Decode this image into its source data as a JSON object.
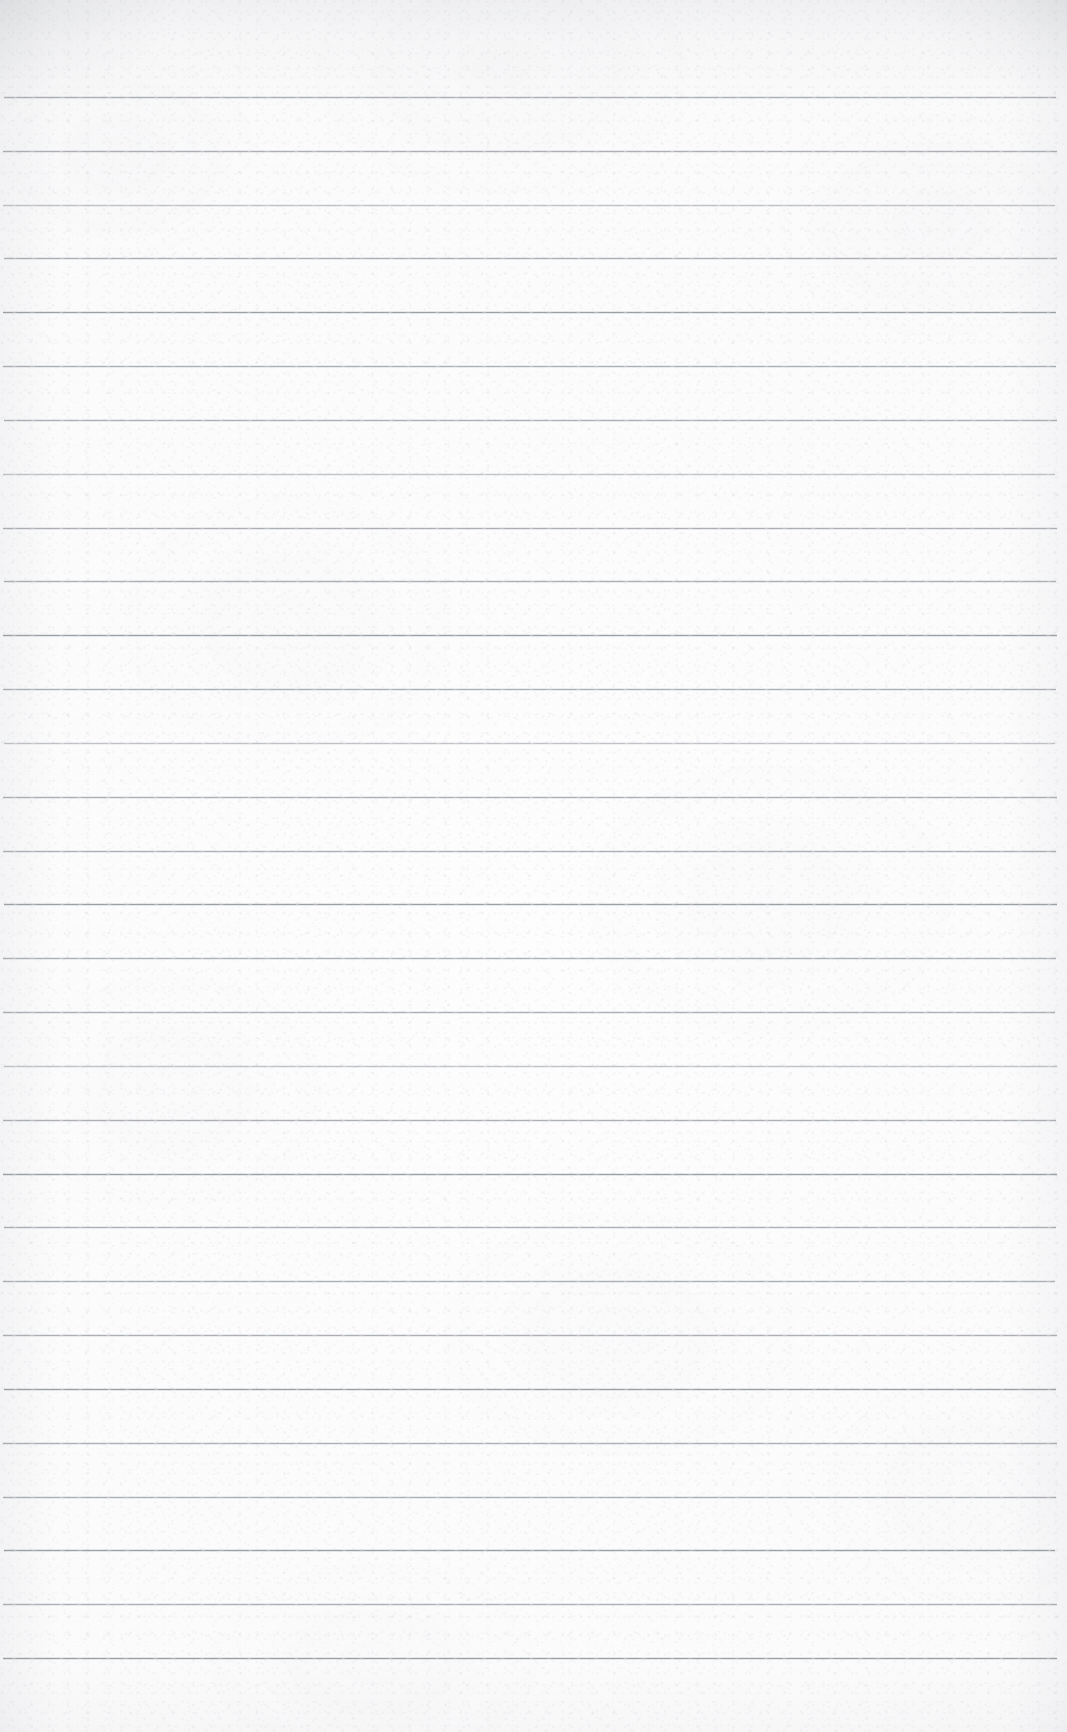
{
  "document": {
    "kind": "scanned-lined-paper",
    "title": "Blank Ruled Notebook Page",
    "content_text": "",
    "has_handwriting": false,
    "has_printed_text": false,
    "page_width": 1067,
    "page_height": 1732
  },
  "paper": {
    "background_color": "#fbfbfc",
    "edge_shade_color": "#94979d",
    "texture": "mottled-fibre",
    "vignette": "top-and-side-edges"
  },
  "ruling": {
    "line_color": "#9ba0a6",
    "line_thickness_px": 1,
    "line_count": 30,
    "first_line_y": 97,
    "line_spacing_px": 53.8,
    "line_start_x": 3,
    "line_end_x": 1057,
    "top_margin_px": 97,
    "bottom_margin_px": 74,
    "has_vertical_margin_rule": false,
    "lines": [
      {
        "y": 97,
        "x1": 4,
        "x2": 1056,
        "weight": "mid"
      },
      {
        "y": 151,
        "x1": 3,
        "x2": 1057,
        "weight": "mid"
      },
      {
        "y": 205,
        "x1": 3,
        "x2": 1055,
        "weight": "light"
      },
      {
        "y": 258,
        "x1": 4,
        "x2": 1057,
        "weight": "mid"
      },
      {
        "y": 312,
        "x1": 3,
        "x2": 1056,
        "weight": "dark"
      },
      {
        "y": 366,
        "x1": 3,
        "x2": 1056,
        "weight": "mid"
      },
      {
        "y": 420,
        "x1": 4,
        "x2": 1057,
        "weight": "mid"
      },
      {
        "y": 474,
        "x1": 3,
        "x2": 1055,
        "weight": "light"
      },
      {
        "y": 528,
        "x1": 3,
        "x2": 1057,
        "weight": "mid"
      },
      {
        "y": 581,
        "x1": 4,
        "x2": 1056,
        "weight": "mid"
      },
      {
        "y": 635,
        "x1": 3,
        "x2": 1057,
        "weight": "dark"
      },
      {
        "y": 689,
        "x1": 3,
        "x2": 1056,
        "weight": "mid"
      },
      {
        "y": 743,
        "x1": 4,
        "x2": 1055,
        "weight": "light"
      },
      {
        "y": 797,
        "x1": 3,
        "x2": 1057,
        "weight": "mid"
      },
      {
        "y": 851,
        "x1": 3,
        "x2": 1056,
        "weight": "mid"
      },
      {
        "y": 904,
        "x1": 4,
        "x2": 1057,
        "weight": "dark"
      },
      {
        "y": 958,
        "x1": 3,
        "x2": 1056,
        "weight": "mid"
      },
      {
        "y": 1012,
        "x1": 3,
        "x2": 1055,
        "weight": "mid"
      },
      {
        "y": 1066,
        "x1": 4,
        "x2": 1057,
        "weight": "light"
      },
      {
        "y": 1120,
        "x1": 3,
        "x2": 1056,
        "weight": "mid"
      },
      {
        "y": 1174,
        "x1": 3,
        "x2": 1057,
        "weight": "dark"
      },
      {
        "y": 1227,
        "x1": 4,
        "x2": 1056,
        "weight": "mid"
      },
      {
        "y": 1281,
        "x1": 3,
        "x2": 1055,
        "weight": "mid"
      },
      {
        "y": 1335,
        "x1": 3,
        "x2": 1057,
        "weight": "mid"
      },
      {
        "y": 1389,
        "x1": 4,
        "x2": 1056,
        "weight": "dark"
      },
      {
        "y": 1443,
        "x1": 3,
        "x2": 1057,
        "weight": "mid"
      },
      {
        "y": 1497,
        "x1": 3,
        "x2": 1056,
        "weight": "mid"
      },
      {
        "y": 1550,
        "x1": 4,
        "x2": 1055,
        "weight": "dark"
      },
      {
        "y": 1604,
        "x1": 3,
        "x2": 1057,
        "weight": "mid"
      },
      {
        "y": 1658,
        "x1": 3,
        "x2": 1057,
        "weight": "dark"
      }
    ]
  }
}
